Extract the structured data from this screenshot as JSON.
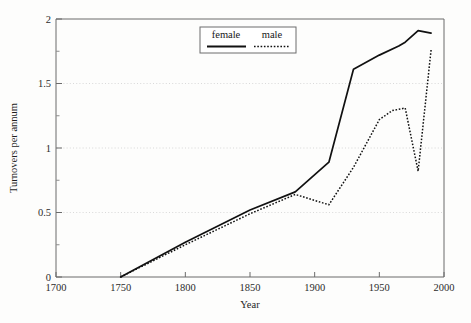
{
  "chart_data": {
    "type": "line",
    "title": "",
    "xlabel": "Year",
    "ylabel": "Turnovers per annum",
    "xlim": [
      1700,
      2000
    ],
    "ylim": [
      0,
      2
    ],
    "grid": true,
    "legend_position": "top-center",
    "x_ticks": [
      1700,
      1750,
      1800,
      1850,
      1900,
      1950,
      2000
    ],
    "x_tick_labels": [
      "1700",
      "1750",
      "1800",
      "1850",
      "1900",
      "1950",
      "2000"
    ],
    "y_ticks": [
      0,
      0.5,
      1,
      1.5,
      2
    ],
    "y_tick_labels": [
      "0",
      "0.5",
      "1",
      "1.5",
      "2"
    ],
    "y_minor_ticks": [
      0.25,
      0.75,
      1.25,
      1.75
    ],
    "gridline_values": [
      0.5,
      1,
      1.5
    ],
    "series": [
      {
        "name": "female",
        "style": "solid",
        "color": "#111111",
        "x": [
          1750,
          1800,
          1850,
          1885,
          1911,
          1930,
          1950,
          1965,
          1970,
          1980,
          1990
        ],
        "values": [
          0,
          0.27,
          0.52,
          0.66,
          0.89,
          1.61,
          1.72,
          1.79,
          1.82,
          1.91,
          1.89
        ]
      },
      {
        "name": "male",
        "style": "dotted",
        "color": "#111111",
        "x": [
          1750,
          1800,
          1850,
          1885,
          1911,
          1930,
          1950,
          1960,
          1970,
          1980,
          1990
        ],
        "values": [
          0,
          0.25,
          0.49,
          0.64,
          0.56,
          0.85,
          1.22,
          1.29,
          1.31,
          0.82,
          1.76
        ]
      }
    ]
  },
  "legend": {
    "entries": [
      {
        "label": "female",
        "style": "solid"
      },
      {
        "label": "male",
        "style": "dotted"
      }
    ]
  }
}
